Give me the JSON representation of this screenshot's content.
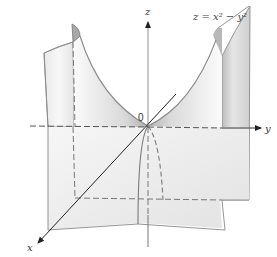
{
  "figure": {
    "equation": "z = x² − y²",
    "axes": {
      "x_label": "x",
      "y_label": "y",
      "z_label": "z",
      "origin_label": "0"
    },
    "colors": {
      "surface_light": "#f4f4f4",
      "surface_mid": "#dcdcdc",
      "surface_dark": "#a9a9a9",
      "edge": "#7a7a7a",
      "axis": "#333333"
    }
  }
}
